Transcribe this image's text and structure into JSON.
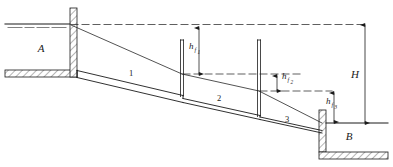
{
  "figure": {
    "type": "engineering-schematic",
    "background_color": "#ffffff",
    "line_color": "#1a1a1a"
  },
  "labels": {
    "reservoir_upper": "A",
    "reservoir_lower": "B",
    "total_head": "H",
    "pipe_segment_1": "1",
    "pipe_segment_2": "2",
    "pipe_segment_3": "3",
    "head_loss_symbol": "h",
    "head_loss_1_sub": "f",
    "head_loss_1_num": "1",
    "head_loss_2_sub": "f",
    "head_loss_2_num": "2",
    "head_loss_3_sub": "f",
    "head_loss_3_num": "3"
  },
  "geometry": {
    "upper_water_surface_y": 24,
    "lower_water_surface_y": 123,
    "hgl_start_x": 70,
    "hgl_start_y": 25,
    "standpipe_1_x": 182,
    "standpipe_2_x": 259,
    "dimension_line_x": 365
  },
  "annotations": {
    "h_f1_top_y": 28,
    "h_f1_bottom_y": 74,
    "h_f2_top_y": 76,
    "h_f2_bottom_y": 91,
    "h_f3_top_y": 93,
    "h_f3_bottom_y": 123
  }
}
